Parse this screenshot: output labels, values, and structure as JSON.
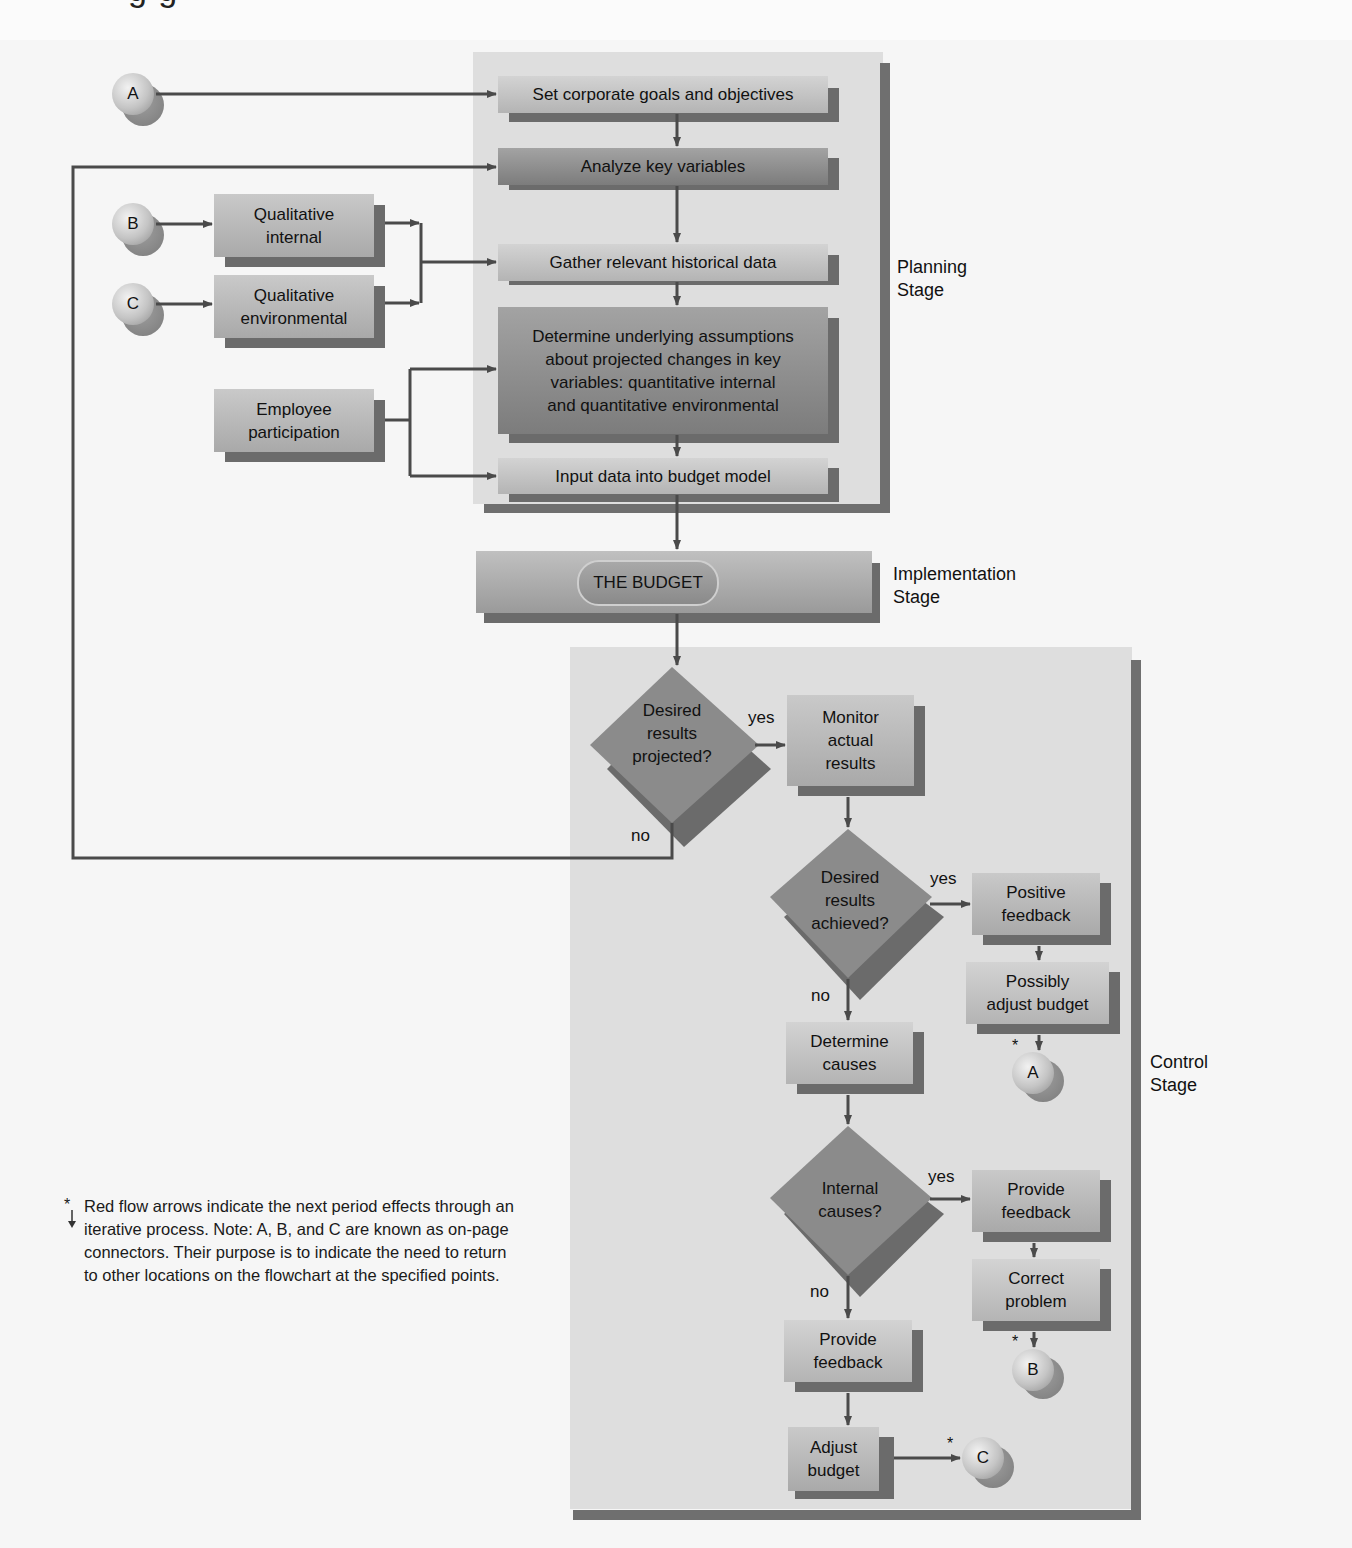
{
  "header": {
    "cut_heading": "g  g"
  },
  "stages": {
    "planning": "Planning\nStage",
    "implementation": "Implementation\nStage",
    "control": "Control\nStage"
  },
  "connectors": {
    "a_start": "A",
    "b_start": "B",
    "c_start": "C",
    "a_end": "A",
    "b_end": "B",
    "c_end": "C"
  },
  "inputs": {
    "qualitative_internal": "Qualitative\ninternal",
    "qualitative_environmental": "Qualitative\nenvironmental",
    "employee_participation": "Employee\nparticipation"
  },
  "planning": {
    "set_goals": "Set corporate goals and objectives",
    "analyze_variables": "Analyze key variables",
    "gather_data": "Gather relevant historical data",
    "determine_assumptions": "Determine underlying assumptions\nabout projected changes in key\nvariables: quantitative internal\nand quantitative environmental",
    "input_data": "Input data into budget model"
  },
  "implementation": {
    "the_budget": "THE BUDGET"
  },
  "control": {
    "decision_projected": "Desired\nresults\nprojected?",
    "monitor_results": "Monitor\nactual\nresults",
    "decision_achieved": "Desired\nresults\nachieved?",
    "positive_feedback": "Positive\nfeedback",
    "possibly_adjust": "Possibly\nadjust budget",
    "determine_causes": "Determine\ncauses",
    "decision_internal": "Internal\ncauses?",
    "provide_feedback_yes": "Provide\nfeedback",
    "correct_problem": "Correct\nproblem",
    "provide_feedback_no": "Provide\nfeedback",
    "adjust_budget": "Adjust\nbudget"
  },
  "edge_labels": {
    "projected_yes": "yes",
    "projected_no": "no",
    "achieved_yes": "yes",
    "achieved_no": "no",
    "internal_yes": "yes",
    "internal_no": "no"
  },
  "stars": {
    "a": "*",
    "b": "*",
    "c": "*"
  },
  "note": {
    "marker": "*",
    "text": "Red flow arrows indicate the next period effects through an iterative process. Note: A, B, and C are known as on-page connectors. Their purpose is to indicate the need to return to other locations on the flowchart at the specified points."
  },
  "colors": {
    "line": "#4a4a4a",
    "panel": "#dedede",
    "panel_border": "#6f6f6f",
    "diamond": "#8a8a8a",
    "shadow": "#6b6b6b"
  }
}
